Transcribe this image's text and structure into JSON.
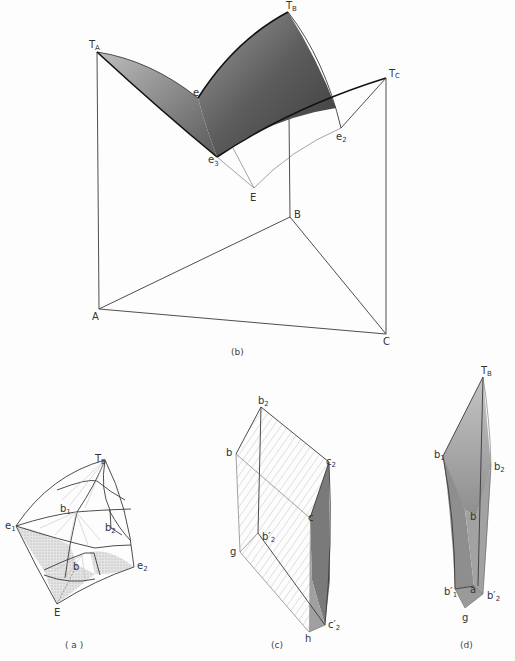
{
  "figure": {
    "panels": [
      {
        "id": "b",
        "caption": "(b)",
        "labels": {
          "TA": "T",
          "TA_sub": "A",
          "TB": "T",
          "TB_sub": "B",
          "TC": "T",
          "TC_sub": "C",
          "e": "e",
          "e2": "e",
          "e2_sub": "2",
          "e3": "e",
          "e3_sub": "3",
          "E": "E",
          "A": "A",
          "B": "B",
          "C": "C"
        }
      },
      {
        "id": "a",
        "caption": "( a )",
        "labels": {
          "TB": "T",
          "TB_sub": "B",
          "e1": "e",
          "e1_sub": "1",
          "e2": "e",
          "e2_sub": "2",
          "b1": "b",
          "b1_sub": "1",
          "b2": "b",
          "b2_sub": "2",
          "b": "b",
          "E": "E"
        }
      },
      {
        "id": "c",
        "caption": "(c)",
        "labels": {
          "b2": "b",
          "b2_sub": "2",
          "b": "b",
          "c2": "c",
          "c2_sub": "2",
          "c": "c",
          "g": "g",
          "b2p": "b′",
          "b2p_sub": "2",
          "h": "h",
          "c2p": "c′",
          "c2p_sub": "2"
        }
      },
      {
        "id": "d",
        "caption": "(d)",
        "labels": {
          "TB": "T",
          "TB_sub": "B",
          "b1": "b",
          "b1_sub": "1",
          "b2": "b",
          "b2_sub": "2",
          "b": "b",
          "b1p": "b′",
          "b1p_sub": "1",
          "a": "a",
          "b2p": "b′",
          "b2p_sub": "2",
          "g": "g"
        }
      }
    ],
    "colors": {
      "line": "#3a3a3a",
      "shade_dark": "#4a4a4a",
      "shade_mid": "#8c8c8c",
      "shade_light": "#c8c8c8",
      "hatch": "#aaaaaa",
      "paper": "#fdfdfd"
    }
  }
}
